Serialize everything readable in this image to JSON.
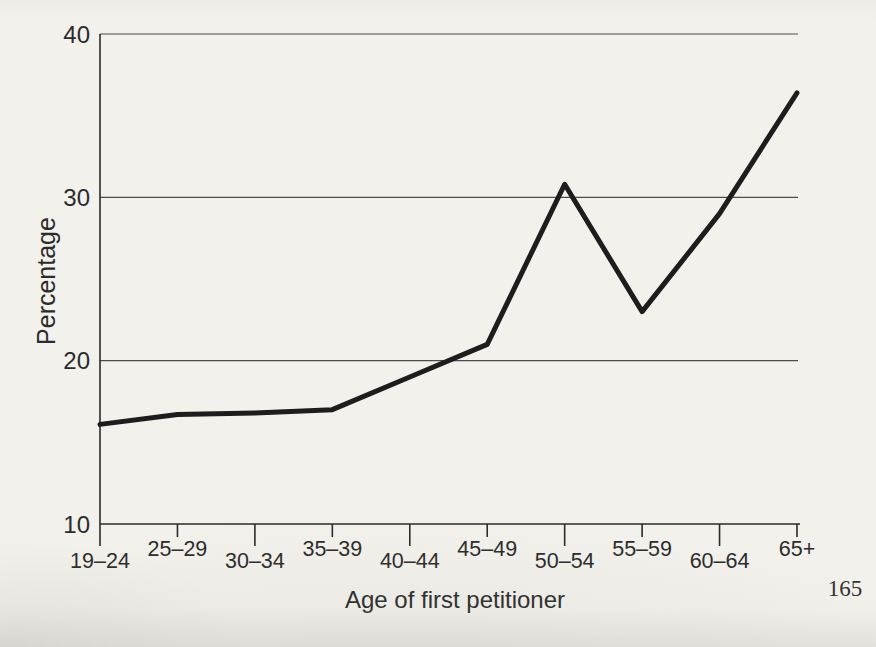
{
  "page": {
    "page_number": "165",
    "background_color": "#f2f1ec",
    "ink_color": "#1d1d1d"
  },
  "chart_data": {
    "type": "line",
    "title": "",
    "xlabel": "Age of first petitioner",
    "ylabel": "Percentage",
    "categories": [
      "19–24",
      "25–29",
      "30–34",
      "35–39",
      "40–44",
      "45–49",
      "50–54",
      "55–59",
      "60–64",
      "65+"
    ],
    "values": [
      16.1,
      16.7,
      16.8,
      17.0,
      19.0,
      21.0,
      30.8,
      23.0,
      29.0,
      36.4
    ],
    "ylim": [
      10,
      40
    ],
    "yticks": [
      10,
      20,
      30,
      40
    ],
    "grid": "horizontal-at-20-30-40",
    "legend": "none",
    "line_color": "#1d1d1d",
    "axis_color": "#2a2a2a",
    "grid_color": "#4c4c4a",
    "x_labels_staggered": true
  }
}
